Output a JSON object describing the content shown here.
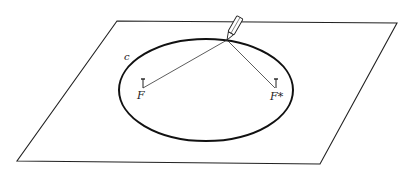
{
  "diagram": {
    "labels": {
      "curve": "c",
      "focus1": "F",
      "focus2": "F*"
    },
    "colors": {
      "ink": "#222222",
      "background": "#ffffff"
    }
  }
}
